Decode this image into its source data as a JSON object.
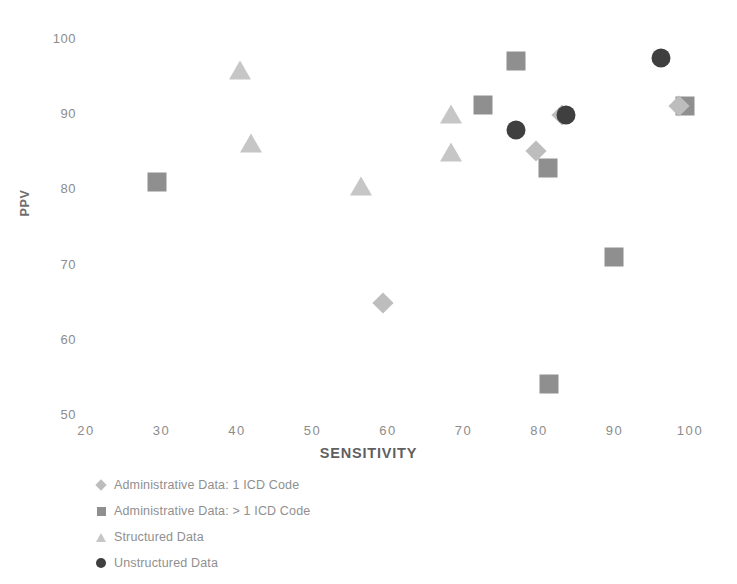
{
  "chart_data": {
    "type": "scatter",
    "title": "",
    "xlabel": "SENSITIVITY",
    "ylabel": "PPV",
    "xlim": [
      20,
      100
    ],
    "ylim": [
      50,
      100
    ],
    "xticks": [
      "20",
      "30",
      "40",
      "50",
      "60",
      "70",
      "80",
      "90",
      "100"
    ],
    "yticks": [
      "100",
      "90",
      "80",
      "70",
      "60",
      "50"
    ],
    "grid": false,
    "legend_position": "bottom-left",
    "series": [
      {
        "name": "Administrative Data: 1 ICD Code",
        "marker": "diamond",
        "color": "#bdbdbd",
        "points": [
          {
            "x": 59.3,
            "y": 64.8
          },
          {
            "x": 79.6,
            "y": 85.0
          },
          {
            "x": 83.0,
            "y": 89.8
          },
          {
            "x": 98.5,
            "y": 91.0
          }
        ]
      },
      {
        "name": "Administrative Data: > 1 ICD Code",
        "marker": "square",
        "color": "#8f8f8f",
        "points": [
          {
            "x": 29.4,
            "y": 80.8
          },
          {
            "x": 72.6,
            "y": 91.1
          },
          {
            "x": 76.9,
            "y": 96.9
          },
          {
            "x": 81.2,
            "y": 82.7
          },
          {
            "x": 81.3,
            "y": 54.0
          },
          {
            "x": 89.9,
            "y": 70.9
          },
          {
            "x": 99.3,
            "y": 91.0
          }
        ]
      },
      {
        "name": "Structured Data",
        "marker": "triangle",
        "color": "#c6c6c6",
        "points": [
          {
            "x": 40.4,
            "y": 95.8
          },
          {
            "x": 41.9,
            "y": 86.0
          },
          {
            "x": 56.4,
            "y": 80.3
          },
          {
            "x": 68.3,
            "y": 89.9
          },
          {
            "x": 68.3,
            "y": 84.8
          }
        ]
      },
      {
        "name": "Unstructured Data",
        "marker": "circle",
        "color": "#3f3f3f",
        "points": [
          {
            "x": 77.0,
            "y": 87.8
          },
          {
            "x": 83.6,
            "y": 89.8
          },
          {
            "x": 96.2,
            "y": 97.3
          }
        ]
      }
    ]
  },
  "legend": [
    {
      "label": "Administrative Data: 1 ICD Code",
      "marker": "diamond-icon",
      "color": "#bdbdbd"
    },
    {
      "label": "Administrative Data: > 1 ICD Code",
      "marker": "square-icon",
      "color": "#8f8f8f"
    },
    {
      "label": "Structured Data",
      "marker": "triangle-icon",
      "color": "#c6c6c6"
    },
    {
      "label": "Unstructured Data",
      "marker": "circle-icon",
      "color": "#3f3f3f"
    }
  ]
}
